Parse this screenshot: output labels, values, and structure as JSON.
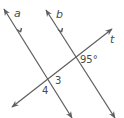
{
  "diagram": {
    "type": "parallel-lines-cut-by-transversal",
    "line_color": "#5f5f5f",
    "text_color": "#4a4a4a",
    "lines": [
      {
        "name": "a",
        "label": "a",
        "from": [
          4,
          9
        ],
        "to": [
          72,
          118
        ],
        "parallel_marker": true
      },
      {
        "name": "b",
        "label": "b",
        "from": [
          46,
          10
        ],
        "to": [
          115,
          118
        ],
        "parallel_marker": true
      },
      {
        "name": "t",
        "label": "t",
        "from": [
          12,
          107
        ],
        "to": [
          112,
          29
        ],
        "parallel_marker": false
      }
    ],
    "angle_labels": {
      "given_angle": "95°",
      "angle_3": "3",
      "angle_4": "4"
    }
  }
}
